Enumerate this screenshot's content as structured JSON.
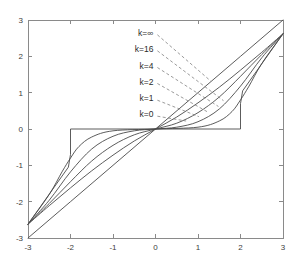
{
  "chart_data": {
    "type": "line",
    "title": "",
    "subtitle": "",
    "xlabel": "",
    "ylabel": "",
    "xlim": [
      -3,
      3
    ],
    "ylim": [
      -3,
      3
    ],
    "grid": false,
    "legend_position": "inside-upper-left-as-leader-labels",
    "xticks": [
      -3,
      -2,
      -1,
      0,
      1,
      2,
      3
    ],
    "yticks": [
      -3,
      -2,
      -1,
      0,
      1,
      2,
      3
    ],
    "xtick_labels": [
      "-3",
      "-2",
      "-1",
      "0",
      "1",
      "2",
      "3"
    ],
    "ytick_labels": [
      "-3",
      "-2",
      "-1",
      "0",
      "1",
      "2",
      "3"
    ],
    "threshold": 2,
    "annotations": [
      {
        "text": "k=∞",
        "x": -0.05,
        "y": 2.62,
        "target_x": 1.3,
        "target_y": 1.32
      },
      {
        "text": "k=16",
        "x": -0.05,
        "y": 2.18,
        "target_x": 1.6,
        "target_y": 0.78
      },
      {
        "text": "k=4",
        "x": -0.05,
        "y": 1.72,
        "target_x": 1.48,
        "target_y": 0.62
      },
      {
        "text": "k=2",
        "x": -0.05,
        "y": 1.28,
        "target_x": 1.24,
        "target_y": 0.46
      },
      {
        "text": "k=1",
        "x": -0.05,
        "y": 0.82,
        "target_x": 1.02,
        "target_y": 0.34
      },
      {
        "text": "k=0",
        "x": -0.05,
        "y": 0.38,
        "target_x": 0.72,
        "target_y": 0.22
      }
    ],
    "series": [
      {
        "name": "k=0",
        "label": "k=0",
        "k": 0,
        "description": "identity line y = x",
        "x": [
          -3,
          -2,
          -1,
          0,
          1,
          2,
          3
        ],
        "values": [
          -3,
          -2,
          -1,
          0,
          1,
          2,
          3
        ]
      },
      {
        "name": "k=1",
        "label": "k=1",
        "k": 1,
        "description": "soft dead-zone, mildest curvature",
        "x": [
          -3,
          -2.5,
          -2,
          -1.5,
          -1,
          -0.5,
          0,
          0.5,
          1,
          1.5,
          2,
          2.5,
          3
        ],
        "values": [
          -2.62,
          -2.11,
          -1.62,
          -1.15,
          -0.72,
          -0.33,
          0,
          0.33,
          0.72,
          1.15,
          1.62,
          2.11,
          2.62
        ]
      },
      {
        "name": "k=2",
        "label": "k=2",
        "k": 2,
        "description": "soft dead-zone, moderate curvature",
        "x": [
          -3,
          -2.5,
          -2,
          -1.5,
          -1,
          -0.5,
          0,
          0.5,
          1,
          1.5,
          2,
          2.5,
          3
        ],
        "values": [
          -2.62,
          -2.05,
          -1.45,
          -0.88,
          -0.45,
          -0.16,
          0,
          0.16,
          0.45,
          0.88,
          1.45,
          2.05,
          2.62
        ]
      },
      {
        "name": "k=4",
        "label": "k=4",
        "k": 4,
        "description": "soft dead-zone, stronger flattening near origin",
        "x": [
          -3,
          -2.5,
          -2,
          -1.5,
          -1,
          -0.5,
          0,
          0.5,
          1,
          1.5,
          2,
          2.5,
          3
        ],
        "values": [
          -2.62,
          -1.96,
          -1.18,
          -0.55,
          -0.2,
          -0.05,
          0,
          0.05,
          0.2,
          0.55,
          1.18,
          1.96,
          2.62
        ]
      },
      {
        "name": "k=16",
        "label": "k=16",
        "k": 16,
        "description": "near-hard dead-zone, sharp knee close to x=±2",
        "x": [
          -3,
          -2.5,
          -2.2,
          -2,
          -1.8,
          -1.5,
          -1,
          0,
          1,
          1.5,
          1.8,
          2,
          2.2,
          2.5,
          3
        ],
        "values": [
          -2.62,
          -1.8,
          -1.18,
          -0.8,
          -0.48,
          -0.22,
          -0.05,
          0,
          0.05,
          0.22,
          0.48,
          0.8,
          1.18,
          1.8,
          2.62
        ]
      },
      {
        "name": "k=∞",
        "label": "k=∞",
        "k": "inf",
        "description": "hard dead-zone: zero inside |x|<2, vertical jump at x=±2, then y=x outside",
        "x": [
          -3,
          -2.05,
          -2,
          -2,
          2,
          2,
          2.05,
          3
        ],
        "values": [
          -2.62,
          -1.05,
          -0.7,
          0,
          0,
          0.7,
          1.05,
          2.62
        ]
      }
    ]
  }
}
